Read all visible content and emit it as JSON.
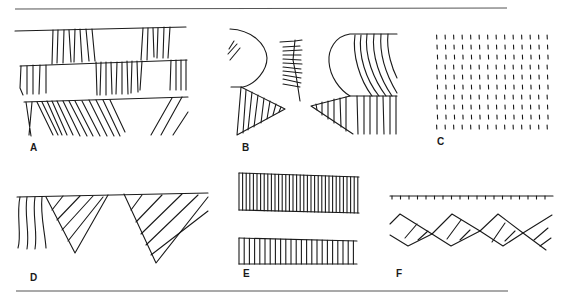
{
  "figure": {
    "type": "pattern-plate",
    "panels": [
      {
        "id": "A",
        "label": "A",
        "description": "Three stacked horizontal bands with vertical and slanted hatching blocks"
      },
      {
        "id": "B",
        "label": "B",
        "description": "Mirrored rounded lobes over hatched triangles with a central herringbone strip"
      },
      {
        "id": "C",
        "label": "C",
        "description": "Grid of short vertical dashes"
      },
      {
        "id": "D",
        "label": "D",
        "description": "Inverted triangles with diagonal hatching along a baseline, wavy verticals at left"
      },
      {
        "id": "E",
        "label": "E",
        "description": "Two horizontal bars filled with dense vertical lines"
      },
      {
        "id": "F",
        "label": "F",
        "description": "Tick-mark line above a zigzag lattice band with cross hatching"
      }
    ]
  },
  "labels": {
    "a": "A",
    "b": "B",
    "c": "C",
    "d": "D",
    "e": "E",
    "f": "F"
  },
  "colors": {
    "ink": "#1a1a1a",
    "rule": "#555555",
    "background": "#ffffff"
  }
}
